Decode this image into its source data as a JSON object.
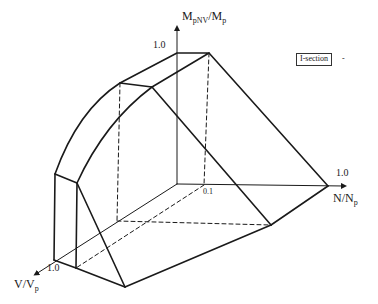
{
  "diagram": {
    "type": "3D interaction surface",
    "legend": "I-section",
    "legend_trailing_mark": "-",
    "axes": {
      "vertical": {
        "main": "M",
        "sub1": "pNV",
        "slash": "/M",
        "sub2": "p",
        "tick": "1.0"
      },
      "horizontal": {
        "main": "N/N",
        "sub": "p",
        "tick": "1.0"
      },
      "depth": {
        "main": "V/V",
        "sub": "p",
        "tick": "1.0"
      }
    },
    "origin_tick": "0.1",
    "stroke_color": "#1a1a1a",
    "background": "#ffffff"
  }
}
